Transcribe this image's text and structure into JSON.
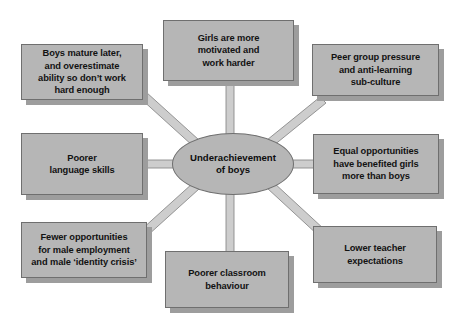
{
  "diagram": {
    "title": "Underachievement of boys",
    "center": {
      "label": "Underachievement\nof boys",
      "shape": "ellipse"
    },
    "colors": {
      "node_fill": "#b6b6b6",
      "node_border": "#6f6f6f",
      "node_shadow": "#9d9d9d",
      "connector_fill": "#c9c9c9",
      "connector_edge": "#8a8a8a",
      "text": "#121212",
      "background": "#ffffff"
    },
    "nodes": [
      {
        "id": "boys-mature-later",
        "label": "Boys mature later,\nand overestimate\nability so don’t work\nhard enough",
        "position": "top-left"
      },
      {
        "id": "girls-more-motivated",
        "label": "Girls are more\nmotivated and\nwork harder",
        "position": "top-center"
      },
      {
        "id": "peer-group-pressure",
        "label": "Peer group pressure\nand anti-learning\nsub-culture",
        "position": "top-right"
      },
      {
        "id": "poorer-language-skills",
        "label": "Poorer\nlanguage skills",
        "position": "middle-left"
      },
      {
        "id": "equal-opportunities",
        "label": "Equal opportunities\nhave benefited girls\nmore than boys",
        "position": "middle-right"
      },
      {
        "id": "fewer-opportunities",
        "label": "Fewer opportunities\nfor male employment\nand male ‘identity crisis’",
        "position": "bottom-left"
      },
      {
        "id": "poorer-classroom-behaviour",
        "label": "Poorer classroom\nbehaviour",
        "position": "bottom-center"
      },
      {
        "id": "lower-teacher-expectations",
        "label": "Lower teacher\nexpectations",
        "position": "bottom-right"
      }
    ]
  }
}
